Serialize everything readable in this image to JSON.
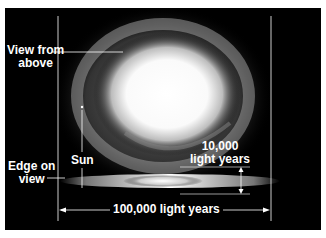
{
  "labels": {
    "view_from_above": "View from\nabove",
    "sun": "Sun",
    "edge_on_view": "Edge on\nview",
    "thickness": "10,000\nlight years",
    "diameter": "100,000 light years"
  },
  "colors": {
    "background": "#000000",
    "line": "#ffffff",
    "frame": "#ffffff"
  }
}
